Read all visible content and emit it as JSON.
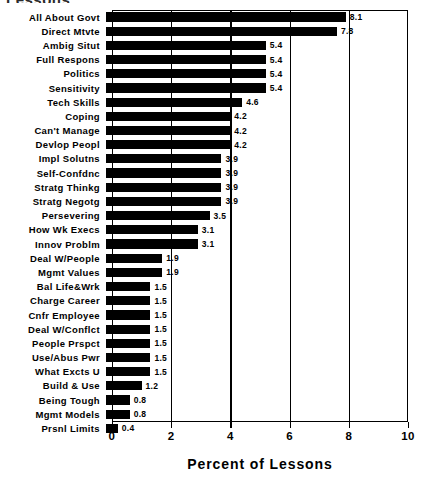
{
  "chart_data": {
    "type": "bar",
    "orientation": "horizontal",
    "title": "Lessons",
    "xlabel": "Percent of Lessons",
    "ylabel": "",
    "xlim": [
      0,
      10
    ],
    "xticks": [
      0,
      2,
      4,
      6,
      8,
      10
    ],
    "xtick_labels": [
      "0",
      "2",
      "4",
      "6",
      "8",
      "10"
    ],
    "grid": true,
    "legend": false,
    "value_labels": true,
    "bar_color": "#000000",
    "categories": [
      "All About Govt",
      "Direct Mtvte",
      "Ambig Situt",
      "Full Respons",
      "Politics",
      "Sensitivity",
      "Tech Skills",
      "Coping",
      "Can't Manage",
      "Devlop Peopl",
      "Impl Solutns",
      "Self-Confdnc",
      "Stratg Thinkg",
      "Stratg Negotg",
      "Persevering",
      "How Wk Execs",
      "Innov Problm",
      "Deal W/People",
      "Mgmt Values",
      "Bal Life&Wrk",
      "Charge Career",
      "Cnfr Employee",
      "Deal W/Conflct",
      "People Prspct",
      "Use/Abus Pwr",
      "What Excts U",
      "Build & Use",
      "Being Tough",
      "Mgmt Models",
      "Prsnl Limits"
    ],
    "values": [
      8.1,
      7.8,
      5.4,
      5.4,
      5.4,
      5.4,
      4.6,
      4.2,
      4.2,
      4.2,
      3.9,
      3.9,
      3.9,
      3.9,
      3.5,
      3.1,
      3.1,
      1.9,
      1.9,
      1.5,
      1.5,
      1.5,
      1.5,
      1.5,
      1.5,
      1.5,
      1.2,
      0.8,
      0.8,
      0.4
    ],
    "value_label_texts": [
      "8.1",
      "7.8",
      "5.4",
      "5.4",
      "5.4",
      "5.4",
      "4.6",
      "4.2",
      "4.2",
      "4.2",
      "3.9",
      "3.9",
      "3.9",
      "3.9",
      "3.5",
      "3.1",
      "3.1",
      "1.9",
      "1.9",
      "1.5",
      "1.5",
      "1.5",
      "1.5",
      "1.5",
      "1.5",
      "1.5",
      "1.2",
      "0.8",
      "0.8",
      "0.4"
    ]
  }
}
